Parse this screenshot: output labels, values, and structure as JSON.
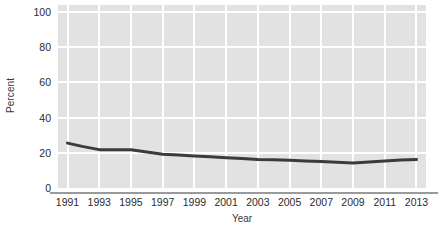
{
  "chart_data": {
    "type": "line",
    "title": "",
    "subtitle": "",
    "xlabel": "Year",
    "ylabel": "Percent",
    "x": [
      1991,
      1992,
      1993,
      1994,
      1995,
      1996,
      1997,
      1998,
      1999,
      2000,
      2001,
      2002,
      2003,
      2004,
      2005,
      2006,
      2007,
      2008,
      2009,
      2010,
      2011,
      2012,
      2013
    ],
    "values": [
      25.5,
      23.5,
      21.8,
      21.7,
      21.7,
      20.4,
      19.2,
      18.7,
      18.2,
      17.7,
      17.2,
      16.7,
      16.2,
      16.1,
      15.8,
      15.4,
      15.1,
      14.6,
      14.2,
      14.8,
      15.4,
      15.9,
      16.2
    ],
    "series": [
      {
        "name": "Percent",
        "color": "#3b3b3b",
        "values": [
          25.5,
          23.5,
          21.8,
          21.7,
          21.7,
          20.4,
          19.2,
          18.7,
          18.2,
          17.7,
          17.2,
          16.7,
          16.2,
          16.1,
          15.8,
          15.4,
          15.1,
          14.6,
          14.2,
          14.8,
          15.4,
          15.9,
          16.2
        ]
      }
    ],
    "xticks": [
      1991,
      1993,
      1995,
      1997,
      1999,
      2001,
      2003,
      2005,
      2007,
      2009,
      2011,
      2013
    ],
    "xticklabels": [
      "1991",
      "1993",
      "1995",
      "1997",
      "1999",
      "2001",
      "2003",
      "2005",
      "2007",
      "2009",
      "2011",
      "2013"
    ],
    "yticks": [
      0,
      20,
      40,
      60,
      80,
      100
    ],
    "yticklabels": [
      "0",
      "20",
      "40",
      "60",
      "80",
      "100"
    ],
    "xlim": [
      1990.4,
      2013.6
    ],
    "ylim": [
      0,
      104
    ],
    "grid": true,
    "grid_color": "#ffffff",
    "plot_background": "#e2e2e2",
    "legend": "none",
    "line_width": 3
  }
}
